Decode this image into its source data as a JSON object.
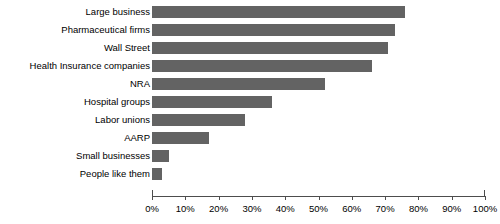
{
  "chart_data": {
    "type": "bar",
    "orientation": "horizontal",
    "title": "",
    "xlabel": "",
    "ylabel": "",
    "categories": [
      "Large business",
      "Pharmaceutical firms",
      "Wall Street",
      "Health Insurance companies",
      "NRA",
      "Hospital groups",
      "Labor unions",
      "AARP",
      "Small businesses",
      "People like them"
    ],
    "values": [
      76,
      73,
      71,
      66,
      52,
      36,
      28,
      17,
      5,
      3
    ],
    "value_suffix": "%",
    "xlim": [
      0,
      100
    ],
    "xticks": [
      0,
      10,
      20,
      30,
      40,
      50,
      60,
      70,
      80,
      90,
      100
    ],
    "xtick_labels": [
      "0%",
      "10%",
      "20%",
      "30%",
      "40%",
      "50%",
      "60%",
      "70%",
      "80%",
      "90%",
      "100%"
    ],
    "grid": false,
    "legend": false,
    "bar_color": "#636363",
    "axis_color": "#4d4d4d",
    "background_color": "#ffffff"
  }
}
